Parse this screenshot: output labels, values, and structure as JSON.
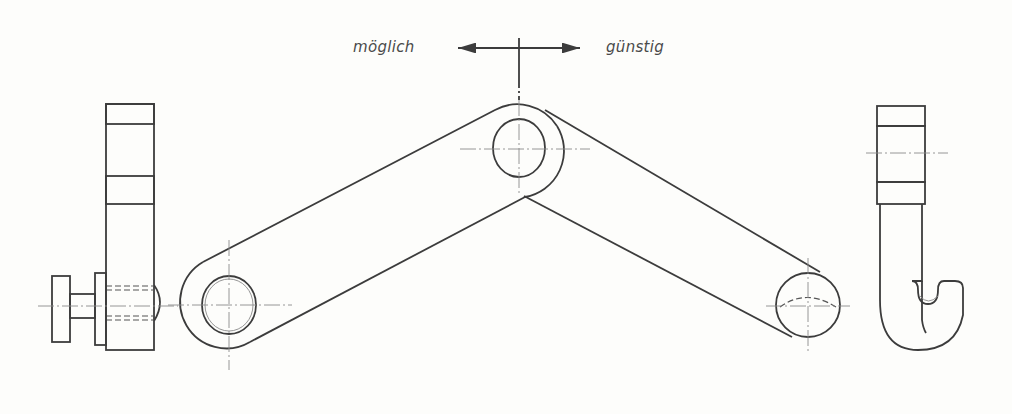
{
  "figure": {
    "type": "technical-drawing",
    "annotations": {
      "direction_left": "möglich",
      "direction_right": "günstig"
    },
    "colors": {
      "line": "#3c3c3c",
      "centerline": "#8a8a8a",
      "background": "#fdfdfb"
    }
  }
}
